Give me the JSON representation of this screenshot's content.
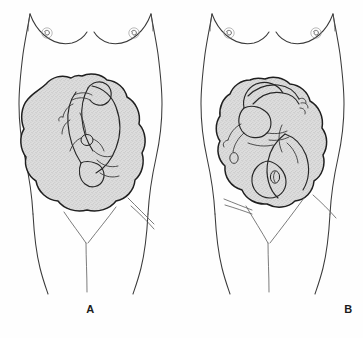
{
  "illustration": {
    "title": "Twin fetal presentations in utero",
    "view": "anterior abdominal view of pregnant female torso",
    "panel_count": 2,
    "background_color": "#fefefe",
    "outline_color": "#3a3a3a",
    "uterus_fill_color": "#d6d6d6",
    "uterus_outline_color": "#1f1f1f",
    "caption_color": "#1c1c1c"
  },
  "panels": [
    {
      "label": "A",
      "name": "panel-a",
      "presentation": "both twins vertex (cephalic) - heads down side by side",
      "uterus_shading": "stippled light gray",
      "fetus_count": 2,
      "fetus_orientation": [
        "vertex left",
        "vertex right"
      ]
    },
    {
      "label": "B",
      "name": "panel-b",
      "presentation": "one twin vertex, one twin breech - fetuses curled opposite",
      "uterus_shading": "stippled light gray",
      "fetus_count": 2,
      "fetus_orientation": [
        "vertex",
        "breech"
      ]
    }
  ],
  "captions": {
    "a": "A",
    "b": "B"
  }
}
